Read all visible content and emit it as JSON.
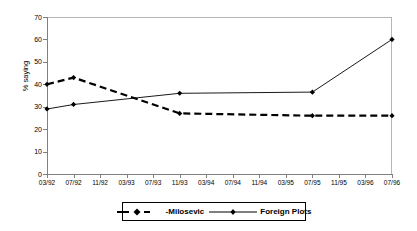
{
  "chart_data": {
    "type": "line",
    "title": "",
    "xlabel": "",
    "ylabel": "% saying",
    "ylim": [
      0,
      70
    ],
    "ytick_step": 10,
    "yticks": [
      "0",
      "10",
      "20",
      "30",
      "40",
      "50",
      "60",
      "70"
    ],
    "grid": false,
    "legend_position": "bottom",
    "categories": [
      "03/92",
      "07/92",
      "11/92",
      "03/93",
      "07/93",
      "11/93",
      "03/94",
      "07/94",
      "11/94",
      "03/95",
      "07/95",
      "11/95",
      "03/96",
      "07/96"
    ],
    "series": [
      {
        "name": "-Milosevic",
        "style": "dashed-thick",
        "marker": "diamond",
        "color": "#000000",
        "points": [
          {
            "x": "03/92",
            "y": 40
          },
          {
            "x": "07/92",
            "y": 43
          },
          {
            "x": "11/93",
            "y": 27
          },
          {
            "x": "07/95",
            "y": 26
          },
          {
            "x": "07/96",
            "y": 26
          }
        ],
        "values": [
          40,
          43,
          null,
          null,
          null,
          27,
          null,
          null,
          null,
          null,
          26,
          null,
          null,
          26
        ]
      },
      {
        "name": "Foreign Plots",
        "style": "solid-thin",
        "marker": "diamond",
        "color": "#000000",
        "points": [
          {
            "x": "03/92",
            "y": 29
          },
          {
            "x": "07/92",
            "y": 31
          },
          {
            "x": "11/93",
            "y": 36
          },
          {
            "x": "07/95",
            "y": 36.5
          },
          {
            "x": "07/96",
            "y": 60
          }
        ],
        "values": [
          29,
          31,
          null,
          null,
          null,
          36,
          null,
          null,
          null,
          null,
          36.5,
          null,
          null,
          60
        ]
      }
    ]
  },
  "legend": {
    "entries": [
      {
        "label": "-Milosevic",
        "icon": "dashed-line-marker-icon"
      },
      {
        "label": "Foreign Plots",
        "icon": "solid-line-marker-icon"
      }
    ]
  },
  "axes": {
    "y_axis_label": "% saying"
  }
}
